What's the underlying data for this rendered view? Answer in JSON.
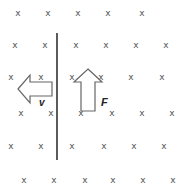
{
  "diagram": {
    "field_symbol": "x",
    "field_marks": {
      "rows": [
        {
          "y": 13,
          "xs": [
            18,
            48,
            78,
            108,
            142
          ]
        },
        {
          "y": 45,
          "xs": [
            15,
            45,
            76,
            106,
            136,
            166
          ]
        },
        {
          "y": 77,
          "xs": [
            11,
            41,
            72,
            101,
            131,
            162
          ]
        },
        {
          "y": 113,
          "xs": [
            21,
            51,
            81,
            112,
            142,
            172
          ]
        },
        {
          "y": 146,
          "xs": [
            11,
            41,
            72,
            104,
            134,
            164
          ]
        },
        {
          "y": 180,
          "xs": [
            24,
            54,
            85,
            113,
            143,
            173
          ]
        }
      ]
    },
    "rod": {
      "x": 57,
      "y1": 33,
      "y2": 160,
      "color": "#333333"
    },
    "arrows": {
      "velocity": {
        "label": "v",
        "direction": "left",
        "color": "#555555"
      },
      "force": {
        "label": "F",
        "direction": "up",
        "color": "#555555"
      }
    },
    "labels": {
      "velocity": "v",
      "force": "F"
    },
    "colors": {
      "background": "#ffffff",
      "marks": "#555555",
      "rod": "#333333",
      "arrow_outline": "#666666",
      "label": "#222222"
    }
  }
}
